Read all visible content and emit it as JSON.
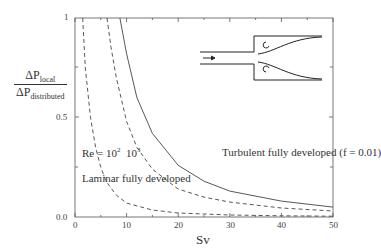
{
  "chart_data": {
    "type": "line",
    "title": "",
    "xlabel": "Sv",
    "ylabel": "ΔP_local / ΔP_distributed",
    "ylabel_parts": {
      "num": "ΔP",
      "num_sub": "local",
      "den": "ΔP",
      "den_sub": "distributed"
    },
    "xlim": [
      0,
      50
    ],
    "ylim": [
      0,
      1
    ],
    "x_ticks": [
      "0",
      "10",
      "20",
      "30",
      "40",
      "50"
    ],
    "y_ticks": [
      "0.0",
      "0.5",
      "1"
    ],
    "grid": false,
    "series": [
      {
        "name": "Laminar fully developed, Re = 10^2",
        "style": "dashed",
        "x": [
          1.5,
          2,
          3,
          4,
          5,
          6,
          8,
          10,
          15,
          20,
          30,
          40,
          50
        ],
        "y": [
          1.0,
          0.75,
          0.5,
          0.35,
          0.25,
          0.18,
          0.11,
          0.07,
          0.035,
          0.02,
          0.01,
          0.006,
          0.004
        ]
      },
      {
        "name": "Laminar fully developed, Re = 10^3",
        "style": "dashed",
        "x": [
          6.2,
          7,
          8,
          10,
          12,
          15,
          20,
          25,
          30,
          40,
          50
        ],
        "y": [
          1.0,
          0.85,
          0.7,
          0.48,
          0.35,
          0.24,
          0.14,
          0.1,
          0.075,
          0.045,
          0.03
        ]
      },
      {
        "name": "Turbulent fully developed (f = 0.01)",
        "style": "solid",
        "x": [
          8.7,
          10,
          12,
          15,
          20,
          25,
          30,
          40,
          50
        ],
        "y": [
          1.0,
          0.82,
          0.6,
          0.42,
          0.26,
          0.18,
          0.13,
          0.08,
          0.05
        ]
      }
    ],
    "annotations": [
      "Turbulent fully developed (f = 0.01)",
      "Re = 10² 10³",
      "Laminar fully developed"
    ],
    "inset": "sudden expansion diffuser sketch with flow arrow and recirculation eddies"
  },
  "labels": {
    "turbulent": "Turbulent fully developed (f = 0.01)",
    "re": "Re = 10",
    "re_exp1": "2",
    "re2": "10",
    "re_exp2": "3",
    "laminar": "Laminar fully developed",
    "xlabel": "Sv",
    "num": "ΔP",
    "num_sub": "local",
    "den": "ΔP",
    "den_sub": "distributed",
    "x0": "0",
    "x10": "10",
    "x20": "20",
    "x30": "30",
    "x40": "40",
    "x50": "50",
    "y0": "0.0",
    "y05": "0.5",
    "y1": "1"
  }
}
